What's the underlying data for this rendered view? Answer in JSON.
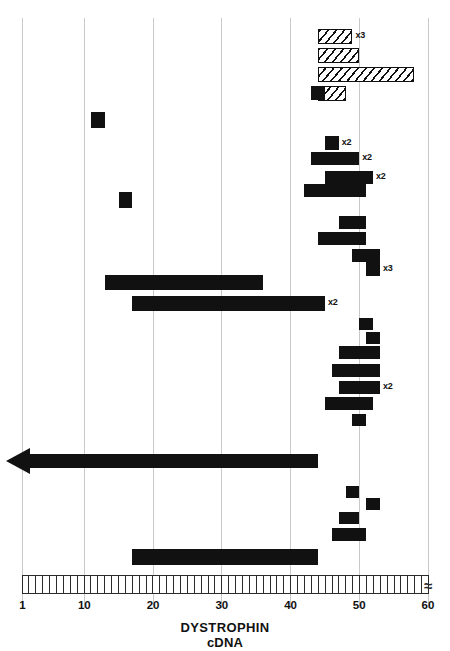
{
  "figure": {
    "title_line1": "DYSTROPHIN",
    "title_line2": "cDNA",
    "axis_break_symbol": "≈"
  },
  "chart_data": {
    "type": "bar",
    "xlabel": "DYSTROPHIN cDNA exon number",
    "ylabel": "",
    "orientation": "horizontal",
    "xlim": [
      1,
      60
    ],
    "grid": true,
    "gridlines_at": [
      1,
      10,
      20,
      30,
      40,
      50,
      60
    ],
    "tick_labels": [
      "1",
      "10",
      "20",
      "30",
      "40",
      "50",
      "60"
    ],
    "legend": [
      {
        "name": "deletion",
        "style": "solid black bar",
        "color": "#111111"
      },
      {
        "name": "duplication",
        "style": "diagonal hatched bar",
        "color": "#111111"
      }
    ],
    "annotations": [
      "x3 = mutation observed in 3 patients",
      "x2 = mutation observed in 2 patients",
      "arrow = deletion extends beyond exon 1"
    ],
    "series": [
      {
        "name": "duplications",
        "type": "duplication",
        "values": [
          {
            "id": "dup-1",
            "exon_start": 44,
            "exon_end": 48,
            "count": "x3"
          },
          {
            "id": "dup-2",
            "exon_start": 44,
            "exon_end": 49,
            "count": ""
          },
          {
            "id": "dup-3",
            "exon_start": 44,
            "exon_end": 57,
            "count": ""
          },
          {
            "id": "dup-4",
            "exon_start": 44,
            "exon_end": 47,
            "count": ""
          }
        ]
      },
      {
        "name": "deletions",
        "type": "deletion",
        "values": [
          {
            "id": "del-1",
            "exon_start": 43,
            "exon_end": 44,
            "count": ""
          },
          {
            "id": "del-2",
            "exon_start": 11,
            "exon_end": 12,
            "count": ""
          },
          {
            "id": "del-3",
            "exon_start": 15,
            "exon_end": 16,
            "count": ""
          },
          {
            "id": "del-4",
            "exon_start": 45,
            "exon_end": 46,
            "count": "x2"
          },
          {
            "id": "del-5",
            "exon_start": 43,
            "exon_end": 49,
            "count": "x2"
          },
          {
            "id": "del-6",
            "exon_start": 45,
            "exon_end": 51,
            "count": "x2"
          },
          {
            "id": "del-7",
            "exon_start": 42,
            "exon_end": 50,
            "count": ""
          },
          {
            "id": "del-8",
            "exon_start": 47,
            "exon_end": 50,
            "count": ""
          },
          {
            "id": "del-9",
            "exon_start": 44,
            "exon_end": 50,
            "count": ""
          },
          {
            "id": "del-10",
            "exon_start": 49,
            "exon_end": 52,
            "count": ""
          },
          {
            "id": "del-11",
            "exon_start": 51,
            "exon_end": 52,
            "count": "x3"
          },
          {
            "id": "del-12",
            "exon_start": 13,
            "exon_end": 35,
            "count": ""
          },
          {
            "id": "del-13",
            "exon_start": 17,
            "exon_end": 44,
            "count": "x2"
          },
          {
            "id": "del-14",
            "exon_start": 50,
            "exon_end": 51,
            "count": ""
          },
          {
            "id": "del-15",
            "exon_start": 51,
            "exon_end": 52,
            "count": ""
          },
          {
            "id": "del-16",
            "exon_start": 47,
            "exon_end": 52,
            "count": ""
          },
          {
            "id": "del-17",
            "exon_start": 46,
            "exon_end": 52,
            "count": ""
          },
          {
            "id": "del-18",
            "exon_start": 47,
            "exon_end": 52,
            "count": "x2"
          },
          {
            "id": "del-19",
            "exon_start": 45,
            "exon_end": 51,
            "count": ""
          },
          {
            "id": "del-20",
            "exon_start": 49,
            "exon_end": 50,
            "count": ""
          },
          {
            "id": "del-21",
            "exon_start": 48,
            "exon_end": 49,
            "count": ""
          },
          {
            "id": "del-22",
            "exon_start": 51,
            "exon_end": 52,
            "count": ""
          },
          {
            "id": "del-23",
            "exon_start": 47,
            "exon_end": 49,
            "count": ""
          },
          {
            "id": "del-24",
            "exon_start": 46,
            "exon_end": 50,
            "count": ""
          },
          {
            "id": "del-25",
            "exon_start": 17,
            "exon_end": 43,
            "count": ""
          }
        ]
      },
      {
        "name": "extended-deletion-arrow",
        "type": "arrow",
        "values": [
          {
            "id": "arrow-1",
            "exon_start": 0,
            "exon_end": 43,
            "count": "",
            "direction": "left"
          }
        ]
      }
    ]
  }
}
